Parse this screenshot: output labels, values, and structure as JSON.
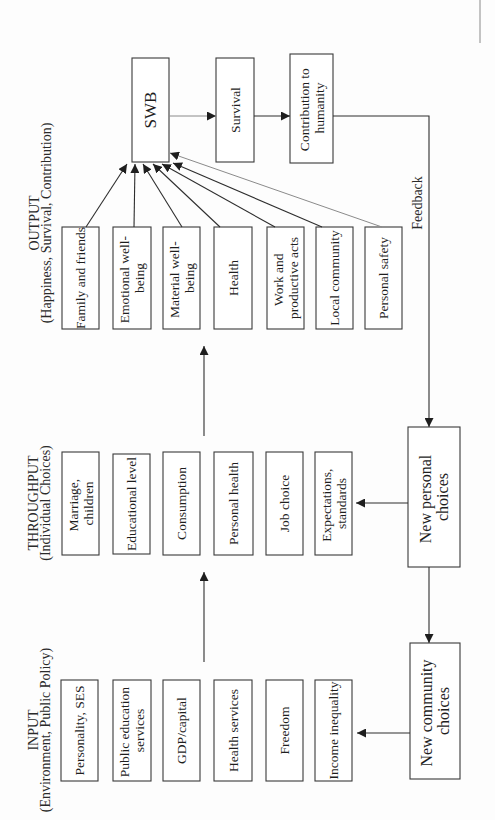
{
  "output": {
    "title": "OUTPUT",
    "subtitle": "(Happiness, Survival, Contribution)",
    "boxes": [
      {
        "lines": [
          "Family and friends"
        ]
      },
      {
        "lines": [
          "Emotional well-",
          "being"
        ]
      },
      {
        "lines": [
          "Material well-",
          "being"
        ]
      },
      {
        "lines": [
          "Health"
        ]
      },
      {
        "lines": [
          "Work and",
          "productive acts"
        ]
      },
      {
        "lines": [
          "Local community"
        ]
      },
      {
        "lines": [
          "Personal safety"
        ]
      }
    ]
  },
  "outcomes": {
    "swb": "SWB",
    "survival": "Survival",
    "contribution": {
      "lines": [
        "Contribution to",
        "humanity"
      ]
    },
    "feedback_label": "Feedback"
  },
  "throughput": {
    "title": "THROUGHPUT",
    "subtitle": "(Individual Choices)",
    "boxes": [
      {
        "lines": [
          "Marriage,",
          "children"
        ]
      },
      {
        "lines": [
          "Educational level"
        ]
      },
      {
        "lines": [
          "Consumption"
        ]
      },
      {
        "lines": [
          "Personal health"
        ]
      },
      {
        "lines": [
          "Job choice"
        ]
      },
      {
        "lines": [
          "Expectations,",
          "standards"
        ]
      }
    ]
  },
  "input": {
    "title": "INPUT",
    "subtitle": "(Environment, Public Policy)",
    "boxes": [
      {
        "lines": [
          "Personality, SES"
        ]
      },
      {
        "lines": [
          "Public education",
          "services"
        ]
      },
      {
        "lines": [
          "GDP/capital"
        ]
      },
      {
        "lines": [
          "Health services"
        ]
      },
      {
        "lines": [
          "Freedom"
        ]
      },
      {
        "lines": [
          "Income inequality"
        ]
      }
    ]
  },
  "choices": {
    "personal": {
      "lines": [
        "New personal",
        "choices"
      ]
    },
    "community": {
      "lines": [
        "New community",
        "choices"
      ]
    }
  }
}
